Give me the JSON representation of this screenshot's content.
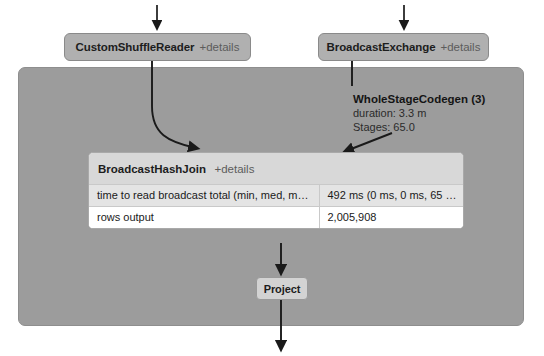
{
  "diagram": {
    "colors": {
      "stage_background": "#9c9c9c",
      "node_background": "#b0b0b0",
      "node_border": "#8a8a8a",
      "panel_header": "#d8d8d8",
      "row_shaded": "#e4e4e4",
      "row_plain": "#ffffff",
      "edge": "#1a1a1a",
      "details_link": "#5c5c5c"
    },
    "nodes": {
      "custom_shuffle_reader": {
        "name": "CustomShuffleReader",
        "details": "+details"
      },
      "broadcast_exchange": {
        "name": "BroadcastExchange",
        "details": "+details"
      },
      "project": {
        "name": "Project"
      },
      "broadcast_hash_join": {
        "name": "BroadcastHashJoin",
        "details": "+details",
        "metrics": [
          {
            "key": "time to read broadcast total (min, med, max)",
            "value": "492 ms (0 ms, 0 ms, 65 ms)"
          },
          {
            "key": "rows output",
            "value": "2,005,908"
          }
        ]
      }
    },
    "cluster_label": {
      "title": "WholeStageCodegen (3)",
      "duration": "duration: 3.3 m",
      "stages": "Stages: 65.0"
    },
    "icons": {
      "arrow_down": "arrow-down-icon",
      "arrow_curve": "arrow-curve-icon"
    }
  }
}
